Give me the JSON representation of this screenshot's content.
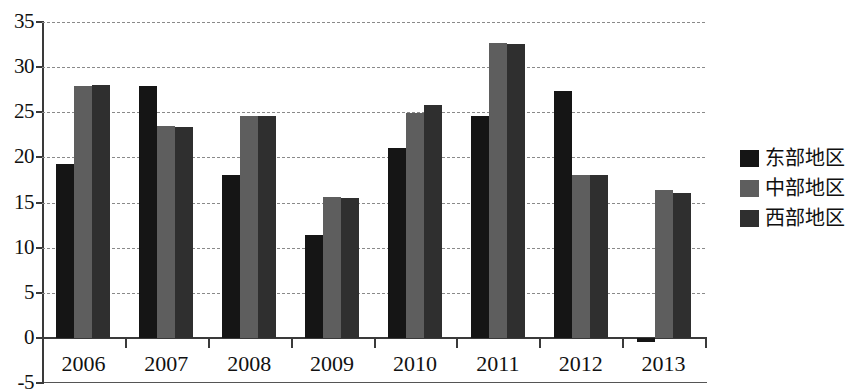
{
  "chart_data": {
    "type": "bar",
    "title": "",
    "subtitle": "",
    "xlabel": "",
    "ylabel": "",
    "grid": true,
    "legend_position": "right",
    "ylim": [
      -5,
      35
    ],
    "yticks": [
      -5,
      0,
      5,
      10,
      15,
      20,
      25,
      30,
      35
    ],
    "ytick_labels": [
      "-5",
      "0",
      "5",
      "10",
      "15",
      "20",
      "25",
      "30",
      "35"
    ],
    "categories": [
      "2006",
      "2007",
      "2008",
      "2009",
      "2010",
      "2011",
      "2012",
      "2013"
    ],
    "series": [
      {
        "name": "东部地区",
        "color": "#151515",
        "values": [
          19.3,
          27.9,
          18.0,
          11.4,
          21.0,
          24.6,
          27.3,
          -0.5
        ]
      },
      {
        "name": "中部地区",
        "color": "#5e5e5e",
        "values": [
          27.9,
          23.5,
          24.6,
          15.6,
          24.9,
          32.7,
          18.1,
          16.4
        ]
      },
      {
        "name": "西部地区",
        "color": "#2f2f2f",
        "values": [
          28.0,
          23.4,
          24.6,
          15.5,
          25.8,
          32.6,
          18.0,
          16.1
        ]
      }
    ]
  },
  "legend": {
    "items": [
      {
        "label": "东部地区",
        "color": "#151515"
      },
      {
        "label": "中部地区",
        "color": "#5e5e5e"
      },
      {
        "label": "西部地区",
        "color": "#2f2f2f"
      }
    ]
  }
}
